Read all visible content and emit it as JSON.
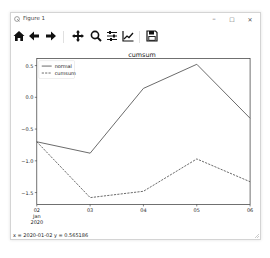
{
  "window": {
    "title": "Figure 1",
    "controls": {
      "minimize": "–",
      "maximize": "☐",
      "close": "✕"
    }
  },
  "toolbar": {
    "items": [
      {
        "name": "home",
        "icon": "home-icon"
      },
      {
        "name": "back",
        "icon": "arrow-left-icon"
      },
      {
        "name": "forward",
        "icon": "arrow-right-icon"
      },
      {
        "name": "pan",
        "icon": "move-icon"
      },
      {
        "name": "zoom",
        "icon": "magnifier-icon"
      },
      {
        "name": "configure-subplots",
        "icon": "sliders-icon"
      },
      {
        "name": "edit-axis",
        "icon": "line-chart-icon"
      },
      {
        "name": "save",
        "icon": "floppy-disk-icon"
      }
    ]
  },
  "status": {
    "text": "x = 2020-01-02  y = 0.565186"
  },
  "colors": {
    "series_line": "#595959",
    "axis": "#333333",
    "text": "#222222"
  },
  "chart_data": {
    "type": "line",
    "title": "cumsum",
    "xlabel": "",
    "ylabel": "",
    "categories": [
      "02",
      "03",
      "04",
      "05",
      "06"
    ],
    "x_tick_labels": [
      "02\nJan\n2020",
      "03",
      "04",
      "05",
      "06"
    ],
    "x_dates": [
      "2020-01-02",
      "2020-01-03",
      "2020-01-04",
      "2020-01-05",
      "2020-01-06"
    ],
    "y_ticks": [
      0.5,
      0.0,
      -0.5,
      -1.0,
      -1.5
    ],
    "y_tick_labels": [
      "0.5",
      "0.0",
      "−0.5",
      "−1.0",
      "−1.5"
    ],
    "ylim": [
      -1.65,
      0.6
    ],
    "grid": false,
    "legend_position": "upper left",
    "series": [
      {
        "name": "normal",
        "style": "solid",
        "values": [
          -0.7,
          -0.88,
          0.14,
          0.52,
          -0.33
        ]
      },
      {
        "name": "cumsum",
        "style": "dashed",
        "values": [
          -0.7,
          -1.58,
          -1.48,
          -0.97,
          -1.33
        ]
      }
    ]
  }
}
